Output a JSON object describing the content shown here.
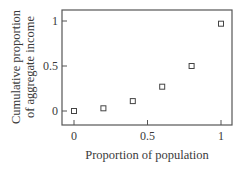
{
  "chart_data": {
    "type": "scatter",
    "title": "",
    "xlabel": "Proportion of population",
    "ylabel_lines": [
      "Cumulative proportion",
      "of aggregate income"
    ],
    "ylabel": "Cumulative proportion of aggregate income",
    "x": [
      0,
      0.2,
      0.4,
      0.6,
      0.8,
      1.0
    ],
    "y": [
      0,
      0.03,
      0.11,
      0.27,
      0.5,
      0.97
    ],
    "marker": "open-square",
    "xlim": [
      -0.07,
      1.07
    ],
    "ylim": [
      -0.07,
      1.13
    ],
    "xticks": [
      0,
      0.5,
      1
    ],
    "xtick_labels": [
      "0",
      "0.5",
      "1"
    ],
    "yticks": [
      0,
      0.5,
      1
    ],
    "ytick_labels": [
      "0",
      "0.5",
      "1"
    ],
    "grid": false,
    "legend": null,
    "colors": {
      "ink": "#3a3a3a",
      "frame": "#555555",
      "background": "#ffffff"
    }
  }
}
